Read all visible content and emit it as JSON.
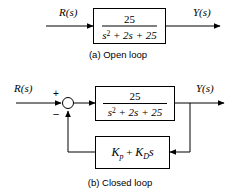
{
  "figure": {
    "type": "block-diagram",
    "line_color": "#000000",
    "background_color": "#ffffff",
    "block_fill": "#ffffff"
  },
  "open_loop": {
    "caption": "(a) Open loop",
    "input_label": "R(s)",
    "output_label": "Y(s)",
    "plant": {
      "name": "plant-transfer-function",
      "numerator": "25",
      "denominator_base": "s",
      "denominator_exponent": "2",
      "denominator_rest": "+ 2s + 25",
      "denominator_full": "s2 + 2s + 25",
      "expression": "25 / (s^2 + 2s + 25)"
    }
  },
  "closed_loop": {
    "caption": "(b) Closed loop",
    "input_label": "R(s)",
    "output_label": "Y(s)",
    "summing_junction": {
      "name": "summing-junction",
      "positive_sign": "+",
      "negative_sign": "–"
    },
    "plant": {
      "name": "plant-transfer-function",
      "numerator": "25",
      "denominator_base": "s",
      "denominator_exponent": "2",
      "denominator_rest": "+ 2s + 25",
      "denominator_full": "s2 + 2s + 25",
      "expression": "25 / (s^2 + 2s + 25)"
    },
    "controller": {
      "name": "pd-controller",
      "term1_base": "K",
      "term1_sub": "p",
      "plus": "+",
      "term2_base": "K",
      "term2_sub": "D",
      "term2_var": "s",
      "expression": "Kp + KDs"
    }
  }
}
